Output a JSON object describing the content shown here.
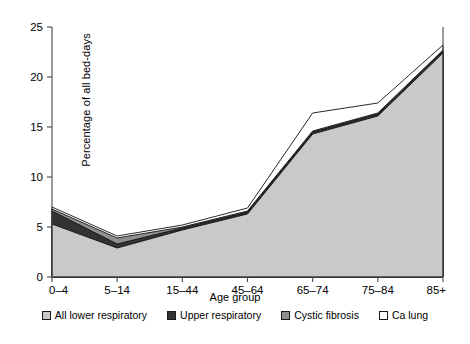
{
  "chart_data": {
    "type": "area",
    "stacked": true,
    "title": "",
    "subtitle": "",
    "xlabel": "Age group",
    "ylabel": "Percentage of all bed-days",
    "categories": [
      "0–4",
      "5–14",
      "15–44",
      "45–64",
      "65–74",
      "75–84",
      "85+"
    ],
    "ytick_labels": [
      "0",
      "5",
      "10",
      "15",
      "20",
      "25"
    ],
    "yticks": [
      0,
      5,
      10,
      15,
      20,
      25
    ],
    "ylim": [
      0,
      25
    ],
    "grid": false,
    "legend_position": "bottom",
    "series": [
      {
        "name": "All lower respiratory",
        "color": "#c9c9c9",
        "swatch": "light-gray",
        "values": [
          5.3,
          2.9,
          4.7,
          6.3,
          14.3,
          16.1,
          22.4
        ]
      },
      {
        "name": "Upper respiratory",
        "color": "#333333",
        "swatch": "dark",
        "values": [
          1.3,
          0.4,
          0.2,
          0.2,
          0.2,
          0.2,
          0.2
        ]
      },
      {
        "name": "Cystic fibrosis",
        "color": "#8f8f8f",
        "swatch": "medium-gray",
        "values": [
          0.2,
          0.6,
          0.1,
          0.1,
          0.1,
          0.1,
          0.1
        ]
      },
      {
        "name": "Ca lung",
        "color": "#ffffff",
        "swatch": "white",
        "values": [
          0.2,
          0.2,
          0.2,
          0.3,
          1.8,
          1.0,
          0.5
        ]
      }
    ],
    "cumulative_tops": {
      "All lower respiratory": [
        5.3,
        2.9,
        4.7,
        6.3,
        14.3,
        16.1,
        22.4
      ],
      "Upper respiratory": [
        6.6,
        3.3,
        4.9,
        6.5,
        14.5,
        16.3,
        22.6
      ],
      "Cystic fibrosis": [
        6.8,
        3.9,
        5.0,
        6.6,
        14.6,
        16.4,
        22.7
      ],
      "Ca lung": [
        7.0,
        4.1,
        5.2,
        6.9,
        16.4,
        17.4,
        23.2
      ]
    }
  },
  "axes": {
    "y_axis_label": "Percentage of all bed-days",
    "x_axis_label": "Age group"
  },
  "legend": {
    "items": [
      {
        "label": "All lower respiratory"
      },
      {
        "label": "Upper respiratory"
      },
      {
        "label": "Cystic fibrosis"
      },
      {
        "label": "Ca lung"
      }
    ]
  }
}
